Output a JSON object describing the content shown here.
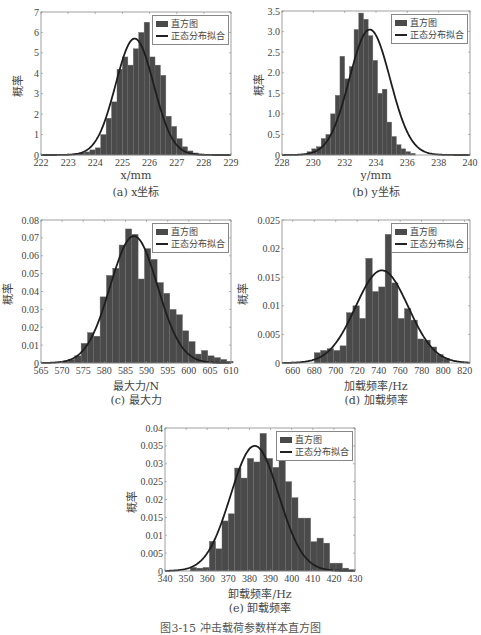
{
  "figure_caption": "图3-15 冲击载荷参数样本直方图",
  "legend": {
    "histogram": "直方图",
    "fit": "正态分布拟合"
  },
  "colors": {
    "bar": "#4a4a4a",
    "bar_edge": "#6a6a6a",
    "curve": "#1e1e1e",
    "axis": "#888888"
  },
  "chart_data": [
    {
      "type": "bar",
      "id": "a",
      "caption": "(a) x坐标",
      "xlabel": "x/mm",
      "ylabel": "概率",
      "xlim": [
        222,
        229
      ],
      "ylim": [
        0,
        7
      ],
      "xticks": [
        222,
        223,
        224,
        225,
        226,
        227,
        228,
        229
      ],
      "yticks": [
        0,
        1,
        2,
        3,
        4,
        5,
        6,
        7
      ],
      "bin_start": 223.0,
      "bin_width": 0.2,
      "values": [
        0.0,
        0.05,
        0.1,
        0.15,
        0.25,
        0.35,
        1.0,
        1.8,
        2.6,
        4.2,
        4.8,
        4.4,
        5.2,
        6.0,
        6.5,
        4.8,
        4.4,
        3.9,
        1.9,
        1.4,
        0.8,
        0.4,
        0.2,
        0.1,
        0.05,
        0.02
      ],
      "fit": {
        "mean": 225.45,
        "std": 0.7,
        "peak": 5.7
      },
      "legend_position": "upper right"
    },
    {
      "type": "bar",
      "id": "b",
      "caption": "(b) y坐标",
      "xlabel": "y/mm",
      "ylabel": "概率",
      "xlim": [
        228,
        240
      ],
      "ylim": [
        0,
        3.5
      ],
      "xticks": [
        228,
        230,
        232,
        234,
        236,
        238,
        240
      ],
      "yticks": [
        0,
        0.5,
        1.0,
        1.5,
        2.0,
        2.5,
        3.0,
        3.5
      ],
      "ytick_labels": [
        "0",
        "0.5",
        "1.0",
        "1.5",
        "2.0",
        "2.5",
        "3.0",
        "3.5"
      ],
      "bin_start": 229.6,
      "bin_width": 0.3,
      "values": [
        0.08,
        0.15,
        0.2,
        0.4,
        0.5,
        1.0,
        1.45,
        2.4,
        1.85,
        2.15,
        3.05,
        3.45,
        3.3,
        2.9,
        2.3,
        1.5,
        1.6,
        0.8,
        0.45,
        0.25,
        0.15,
        0.08,
        0.04
      ],
      "fit": {
        "mean": 233.6,
        "std": 1.3,
        "peak": 3.05
      },
      "legend_position": "upper right"
    },
    {
      "type": "bar",
      "id": "c",
      "caption": "(c) 最大力",
      "xlabel": "最大力/N",
      "ylabel": "概率",
      "xlim": [
        565,
        610
      ],
      "ylim": [
        0,
        0.08
      ],
      "xticks": [
        565,
        570,
        575,
        580,
        585,
        590,
        595,
        600,
        605,
        610
      ],
      "yticks": [
        0,
        0.01,
        0.02,
        0.03,
        0.04,
        0.05,
        0.06,
        0.07,
        0.08
      ],
      "bin_start": 570.0,
      "bin_width": 1.5,
      "values": [
        0.001,
        0.002,
        0.004,
        0.011,
        0.017,
        0.015,
        0.037,
        0.049,
        0.053,
        0.066,
        0.075,
        0.072,
        0.047,
        0.064,
        0.058,
        0.045,
        0.039,
        0.03,
        0.027,
        0.018,
        0.012,
        0.005,
        0.007,
        0.004,
        0.003,
        0.002,
        0.001
      ],
      "fit": {
        "mean": 587.0,
        "std": 5.6,
        "peak": 0.071
      },
      "legend_position": "upper right"
    },
    {
      "type": "bar",
      "id": "d",
      "caption": "(d) 加载频率",
      "xlabel": "加载频率/Hz",
      "ylabel": "概率",
      "xlim": [
        650,
        825
      ],
      "ylim": [
        0,
        0.025
      ],
      "xticks": [
        660,
        680,
        700,
        720,
        740,
        760,
        780,
        800,
        820
      ],
      "yticks": [
        0,
        0.005,
        0.01,
        0.015,
        0.02,
        0.025
      ],
      "bin_start": 680,
      "bin_width": 6,
      "values": [
        0.0018,
        0.0022,
        0.0025,
        0.0022,
        0.003,
        0.0088,
        0.01,
        0.0078,
        0.0183,
        0.0125,
        0.0133,
        0.0225,
        0.014,
        0.0078,
        0.0095,
        0.0075,
        0.0042,
        0.004,
        0.0028,
        0.0015,
        0.0008
      ],
      "fit": {
        "mean": 743,
        "std": 24.5,
        "peak": 0.0162
      },
      "legend_position": "upper right"
    },
    {
      "type": "bar",
      "id": "e",
      "caption": "(e) 卸载频率",
      "xlabel": "卸载频率/Hz",
      "ylabel": "概率",
      "xlim": [
        340,
        430
      ],
      "ylim": [
        0,
        0.04
      ],
      "xticks": [
        340,
        350,
        360,
        370,
        380,
        390,
        400,
        410,
        420,
        430
      ],
      "yticks": [
        0,
        0.005,
        0.01,
        0.015,
        0.02,
        0.025,
        0.03,
        0.035,
        0.04
      ],
      "ytick_labels": [
        "0",
        "0.005",
        "0.01",
        "0.015",
        "0.02",
        "0.025",
        "0.03",
        "0.035",
        "0.04"
      ],
      "bin_start": 352,
      "bin_width": 3,
      "values": [
        0.001,
        0.0008,
        0.001,
        0.0083,
        0.0062,
        0.014,
        0.016,
        0.0288,
        0.026,
        0.0315,
        0.0305,
        0.0385,
        0.0315,
        0.029,
        0.0315,
        0.025,
        0.0205,
        0.0148,
        0.0148,
        0.0082,
        0.0092,
        0.0078,
        0.0022,
        0.0022,
        0.0008,
        0.0004
      ],
      "fit": {
        "mean": 382.5,
        "std": 11.4,
        "peak": 0.035
      },
      "legend_position": "upper right"
    }
  ],
  "layout": [
    {
      "left": 41,
      "top": 12,
      "width": 190,
      "height": 143
    },
    {
      "left": 282,
      "top": 11,
      "width": 188,
      "height": 144
    },
    {
      "left": 41,
      "top": 220,
      "width": 190,
      "height": 143
    },
    {
      "left": 282,
      "top": 220,
      "width": 188,
      "height": 143
    },
    {
      "left": 165,
      "top": 428,
      "width": 190,
      "height": 143
    }
  ]
}
